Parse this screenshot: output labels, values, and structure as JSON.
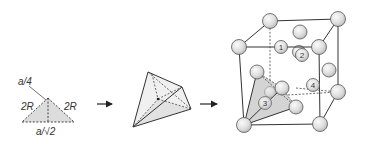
{
  "panels": [
    {
      "id": "triangle",
      "description": "Shaded cross-section triangle with dashed edges",
      "labels": {
        "top": "a/4",
        "left_side": "2R",
        "right_side": "2R",
        "base": "a/√2"
      }
    },
    {
      "id": "tetrahedron",
      "description": "Tetrahedral interstitial void wireframe"
    },
    {
      "id": "cube",
      "description": "FCC unit cell with highlighted tetrahedral site",
      "site_labels": [
        "1",
        "2",
        "3",
        "4"
      ]
    }
  ],
  "arrows": [
    {
      "id": "arrow-1",
      "direction": "right"
    },
    {
      "id": "arrow-2",
      "direction": "right"
    }
  ],
  "colors": {
    "line": "#333333",
    "shade": "#d8d8d8",
    "sphere_fill": "#e6e6e6",
    "sphere_edge": "#555555"
  }
}
